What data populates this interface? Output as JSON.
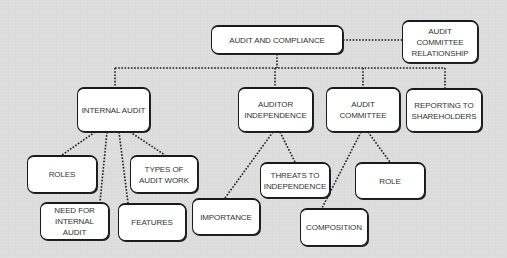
{
  "diagram": {
    "root": {
      "label": "AUDIT AND COMPLIANCE"
    },
    "side": {
      "label": "AUDIT\nCOMMITTEE\nRELATIONSHIP"
    },
    "branches": [
      {
        "label": "INTERNAL AUDIT",
        "children": [
          {
            "label": "ROLES"
          },
          {
            "label": "TYPES OF\nAUDIT WORK"
          },
          {
            "label": "NEED FOR\nINTERNAL AUDIT"
          },
          {
            "label": "FEATURES"
          }
        ]
      },
      {
        "label": "AUDITOR\nINDEPENDENCE",
        "children": [
          {
            "label": "IMPORTANCE"
          },
          {
            "label": "THREATS TO\nINDEPENDENCE"
          }
        ]
      },
      {
        "label": "AUDIT\nCOMMITTEE",
        "children": [
          {
            "label": "COMPOSITION"
          },
          {
            "label": "ROLE"
          }
        ]
      },
      {
        "label": "REPORTING TO\nSHAREHOLDERS"
      }
    ]
  },
  "colors": {
    "background": "#dcdcdc",
    "node_fill": "#ffffff",
    "border": "#1a1a1a",
    "connector": "#1a1a1a"
  }
}
